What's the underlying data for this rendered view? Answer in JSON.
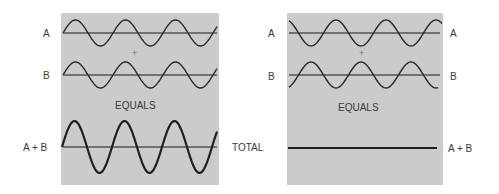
{
  "colors": {
    "panel_bg": "#cbcbcb",
    "wave": "#2a2a2a",
    "axis": "#555555",
    "text": "#3a3a3a",
    "page_bg": "#ffffff"
  },
  "left_panel": {
    "title": "Constructive interference",
    "wave_a_label": "A",
    "wave_b_label": "B",
    "plus_sign": "+",
    "equals_label": "EQUALS",
    "sum_label": "A + B"
  },
  "center": {
    "total_label": "TOTAL"
  },
  "right_panel": {
    "title": "Destructive interference",
    "wave_a_label_left": "A",
    "wave_a_label_right": "A",
    "wave_b_label_left": "B",
    "wave_b_label_right": "B",
    "plus_sign": "+",
    "equals_label": "EQUALS",
    "sum_label": "A + B"
  },
  "waves": {
    "period_px": 50,
    "amplitude_px": 13,
    "sum_amplitude_px": 26,
    "left_a_phase": "in-phase",
    "left_b_phase": "in-phase",
    "right_a_phase": "shifted",
    "right_b_phase": "inverted"
  }
}
